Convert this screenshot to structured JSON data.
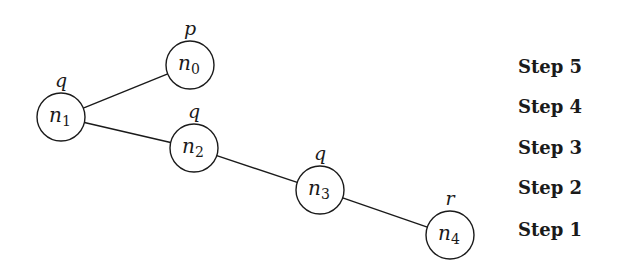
{
  "diagram": {
    "nodes": [
      {
        "id": "n0",
        "label": "n",
        "sub": "0",
        "prop": "p",
        "cx": 190,
        "cy": 65
      },
      {
        "id": "n1",
        "label": "n",
        "sub": "1",
        "prop": "q",
        "cx": 61,
        "cy": 117
      },
      {
        "id": "n2",
        "label": "n",
        "sub": "2",
        "prop": "q",
        "cx": 194,
        "cy": 148
      },
      {
        "id": "n3",
        "label": "n",
        "sub": "3",
        "prop": "q",
        "cx": 320,
        "cy": 190
      },
      {
        "id": "n4",
        "label": "n",
        "sub": "4",
        "prop": "r",
        "cx": 450,
        "cy": 235
      }
    ],
    "edges": [
      {
        "from": "n1",
        "to": "n0"
      },
      {
        "from": "n1",
        "to": "n2"
      },
      {
        "from": "n2",
        "to": "n3"
      },
      {
        "from": "n3",
        "to": "n4"
      }
    ],
    "radius": 24
  },
  "steps": [
    {
      "label": "Step 5",
      "y": 56
    },
    {
      "label": "Step 4",
      "y": 96
    },
    {
      "label": "Step 3",
      "y": 137
    },
    {
      "label": "Step 2",
      "y": 177
    },
    {
      "label": "Step 1",
      "y": 219
    }
  ],
  "colors": {
    "stroke": "#1a1a1a",
    "background": "#ffffff"
  }
}
